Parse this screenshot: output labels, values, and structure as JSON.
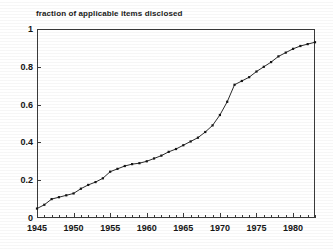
{
  "chart_data": {
    "type": "line",
    "title": "fraction of applicable items disclosed",
    "xlabel": "",
    "ylabel": "",
    "xlim": [
      1945,
      1983
    ],
    "ylim": [
      0,
      1
    ],
    "grid": false,
    "legend": "none",
    "marker": "filled-square",
    "x_ticks_major": [
      1945,
      1950,
      1955,
      1960,
      1965,
      1970,
      1975,
      1980
    ],
    "x_tick_labels": [
      "1945",
      "1950",
      "1955",
      "1960",
      "1965",
      "1970",
      "1975",
      "1980"
    ],
    "x_minor_tick_step": 1,
    "y_ticks": [
      0,
      0.2,
      0.4,
      0.6,
      0.8,
      1
    ],
    "y_tick_labels": [
      "0",
      "0.2",
      "0.4",
      "0.6",
      "0.8",
      "1"
    ],
    "series": [
      {
        "name": "fraction of applicable items disclosed",
        "color": "#2b2b2b",
        "x": [
          1945,
          1946,
          1947,
          1948,
          1949,
          1950,
          1951,
          1952,
          1953,
          1954,
          1955,
          1956,
          1957,
          1958,
          1959,
          1960,
          1961,
          1962,
          1963,
          1964,
          1965,
          1966,
          1967,
          1968,
          1969,
          1970,
          1971,
          1972,
          1973,
          1974,
          1975,
          1976,
          1977,
          1978,
          1979,
          1980,
          1981,
          1982,
          1983
        ],
        "values": [
          0.05,
          0.07,
          0.1,
          0.11,
          0.12,
          0.13,
          0.155,
          0.175,
          0.19,
          0.21,
          0.245,
          0.26,
          0.275,
          0.285,
          0.29,
          0.3,
          0.315,
          0.33,
          0.35,
          0.365,
          0.385,
          0.405,
          0.425,
          0.455,
          0.49,
          0.545,
          0.615,
          0.705,
          0.725,
          0.745,
          0.775,
          0.8,
          0.825,
          0.855,
          0.875,
          0.895,
          0.91,
          0.92,
          0.93
        ]
      }
    ]
  },
  "figure": {
    "background_color": "#ffffff",
    "axis_color": "#3a3a3a",
    "text_color": "#161616"
  }
}
